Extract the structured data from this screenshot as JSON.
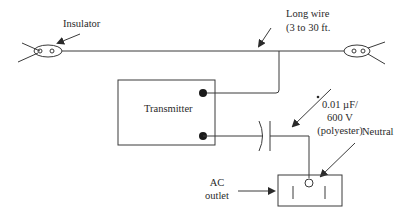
{
  "diagram": {
    "type": "circuit-wiring",
    "labels": {
      "insulator": "Insulator",
      "long_wire_line1": "Long wire",
      "long_wire_line2": "(3 to 30 ft.",
      "transmitter": "Transmitter",
      "capacitor_line1": "0.01 µF/",
      "capacitor_line2": "600 V",
      "capacitor_line3": "(polyester)",
      "neutral": "Neutral",
      "ac_outlet_line1": "AC",
      "ac_outlet_line2": "outlet"
    },
    "components": [
      "left-insulator",
      "right-insulator",
      "long-wire",
      "transmitter",
      "capacitor",
      "ac-outlet"
    ],
    "colors": {
      "line": "#3a3a3a",
      "text": "#2a2a2a",
      "background": "#ffffff"
    }
  }
}
